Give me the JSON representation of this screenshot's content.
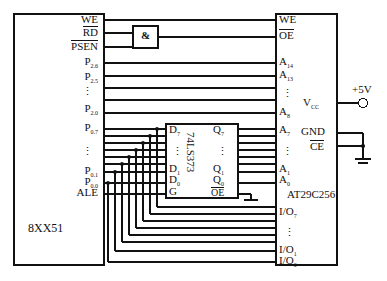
{
  "diagram": {
    "type": "schematic",
    "line_color": "#111111",
    "background": "#ffffff"
  },
  "mcu": {
    "name": "8XX51",
    "pins": [
      {
        "label": "WE",
        "overbar": true,
        "y": 20
      },
      {
        "label": "RD",
        "overbar": true,
        "y": 33
      },
      {
        "label": "PSEN",
        "overbar": true,
        "y": 47
      },
      {
        "label": "P",
        "sub": "2.6",
        "overbar": false,
        "y": 63
      },
      {
        "label": "P",
        "sub": "2.5",
        "overbar": false,
        "y": 78
      },
      {
        "label": "P",
        "sub": "2.0",
        "overbar": false,
        "y": 110
      },
      {
        "label": "P",
        "sub": "0.7",
        "overbar": false,
        "y": 129
      },
      {
        "label": "P",
        "sub": "0.1",
        "overbar": false,
        "y": 172
      },
      {
        "label": "P",
        "sub": "0.0",
        "overbar": false,
        "y": 183
      },
      {
        "label": "ALE",
        "overbar": false,
        "y": 194
      }
    ],
    "ellipsis_y": 93
  },
  "andgate": {
    "symbol": "&",
    "inputs": [
      "RD",
      "PSEN"
    ],
    "output": "OE"
  },
  "latch": {
    "name": "74LS373",
    "inputs": [
      {
        "label": "D",
        "sub": "7",
        "y": 131
      },
      {
        "label": "D",
        "sub": "1",
        "y": 170
      },
      {
        "label": "D",
        "sub": "0",
        "y": 181
      },
      {
        "label": "G",
        "sub": "",
        "y": 192
      }
    ],
    "outputs": [
      {
        "label": "Q",
        "sub": "7",
        "y": 131
      },
      {
        "label": "Q",
        "sub": "1",
        "y": 170
      },
      {
        "label": "Q",
        "sub": "0",
        "y": 181
      },
      {
        "label": "OE",
        "sub": "",
        "overbar": true,
        "y": 192
      }
    ],
    "input_ellipsis_y": 152,
    "output_ellipsis_y": 152
  },
  "memory": {
    "name": "AT29C256",
    "control_pins": [
      {
        "label": "WE",
        "overbar": true,
        "y": 20
      },
      {
        "label": "OE",
        "overbar": true,
        "y": 36
      }
    ],
    "address_pins": [
      {
        "label": "A",
        "sub": "14",
        "y": 63
      },
      {
        "label": "A",
        "sub": "13",
        "y": 76
      },
      {
        "label": "A",
        "sub": "8",
        "y": 113
      },
      {
        "label": "A",
        "sub": "7",
        "y": 131
      },
      {
        "label": "A",
        "sub": "1",
        "y": 170
      },
      {
        "label": "A",
        "sub": "0",
        "y": 181
      }
    ],
    "address_ellipsis_upper_y": 95,
    "address_ellipsis_lower_y": 152,
    "io_pins": [
      {
        "label": "I/O",
        "sub": "7",
        "y": 213
      },
      {
        "label": "I/O",
        "sub": "1",
        "y": 251
      },
      {
        "label": "I/O",
        "sub": "0",
        "y": 262
      }
    ],
    "io_ellipsis_y": 233,
    "power_pins": [
      {
        "label": "V",
        "sub": "CC",
        "y": 103
      },
      {
        "label": "GND",
        "sub": "",
        "y": 133
      },
      {
        "label": "CE",
        "sub": "",
        "overbar": true,
        "y": 146
      }
    ]
  },
  "supply": {
    "label": "+5V",
    "terminal": "open-circle"
  },
  "ground": {
    "label": "",
    "symbol": "earth-bar"
  }
}
